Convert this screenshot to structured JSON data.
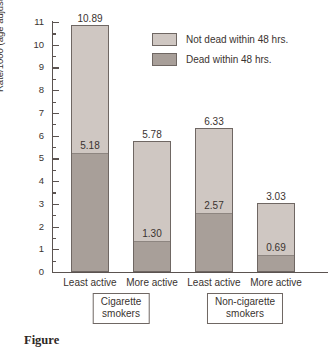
{
  "chart_data": {
    "type": "bar",
    "title": "",
    "xlabel": "",
    "ylabel": "Rate/1000 (age adjusted)",
    "ylim": [
      0,
      11
    ],
    "grid": false,
    "stacked": true,
    "legend_position": "upper-center-right",
    "categories": [
      "Least active",
      "More active",
      "Least active",
      "More active"
    ],
    "groups": [
      {
        "label_line1": "Cigarette",
        "label_line2": "smokers",
        "categories": [
          "Least active",
          "More active"
        ]
      },
      {
        "label_line1": "Non-cigarette",
        "label_line2": "smokers",
        "categories": [
          "Least active",
          "More active"
        ]
      }
    ],
    "series": [
      {
        "name": "Not dead within 48 hrs.",
        "color": "#cfc7c2",
        "values": [
          5.71,
          4.48,
          3.76,
          2.34
        ]
      },
      {
        "name": "Dead within 48 hrs.",
        "color": "#a89f99",
        "values": [
          5.18,
          1.3,
          2.57,
          0.69
        ]
      }
    ],
    "bars": [
      {
        "category": "Least active",
        "group": "Cigarette smokers",
        "total": "10.89",
        "total_value": 10.89,
        "dead": "5.18",
        "dead_value": 5.18
      },
      {
        "category": "More active",
        "group": "Cigarette smokers",
        "total": "5.78",
        "total_value": 5.78,
        "dead": "1.30",
        "dead_value": 1.3
      },
      {
        "category": "Least active",
        "group": "Non-cigarette smokers",
        "total": "6.33",
        "total_value": 6.33,
        "dead": "2.57",
        "dead_value": 2.57
      },
      {
        "category": "More active",
        "group": "Non-cigarette smokers",
        "total": "3.03",
        "total_value": 3.03,
        "dead": "0.69",
        "dead_value": 0.69
      }
    ],
    "y_ticks": [
      "0",
      "1",
      "2",
      "3",
      "4",
      "5",
      "6",
      "7",
      "8",
      "9",
      "10",
      "11"
    ],
    "legend": [
      {
        "label": "Not dead within 48 hrs.",
        "color": "#cfc7c2"
      },
      {
        "label": "Dead within 48 hrs.",
        "color": "#a89f99"
      }
    ]
  },
  "caption": "Figure",
  "colors": {
    "light_fill": "#cfc7c2",
    "dark_fill": "#a89f99",
    "outline": "#6f6763",
    "text": "#3a3330"
  }
}
